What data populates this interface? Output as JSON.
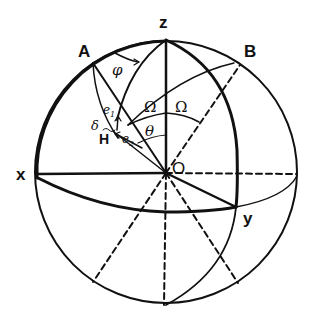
{
  "diagram": {
    "type": "spherical coordinate diagram",
    "labels": {
      "z": "z",
      "x": "x",
      "y": "y",
      "origin": "O",
      "A": "A",
      "B": "B",
      "H": "H",
      "phi": "φ",
      "omega_left": "Ω",
      "omega_right": "Ω",
      "theta": "θ",
      "delta": "δ",
      "e1": "e",
      "e1_sub": "1",
      "e2": "e",
      "e2_sub": "2"
    },
    "colors": {
      "ink": "#111111",
      "background": "#ffffff"
    },
    "geometry": {
      "center": [
        166,
        173
      ],
      "radius": 131,
      "points": {
        "Z": [
          166,
          39
        ],
        "A": [
          93,
          63
        ],
        "B": [
          240,
          65
        ],
        "X": [
          37,
          174
        ],
        "Y": [
          235,
          207
        ],
        "H": [
          114,
          132
        ],
        "bottom": [
          164,
          305
        ]
      }
    }
  }
}
